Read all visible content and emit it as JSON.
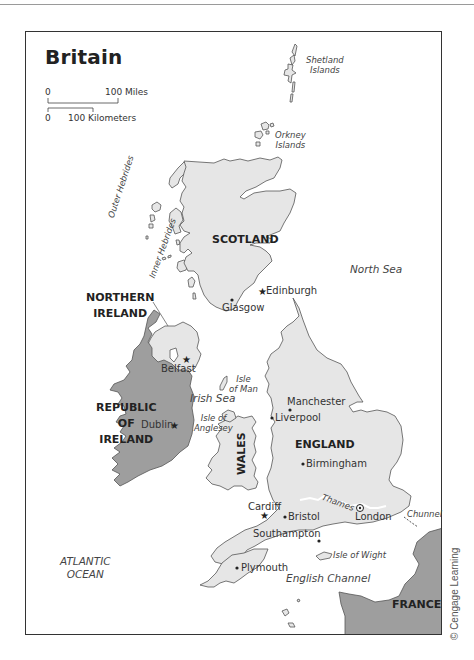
{
  "map": {
    "title": "Britain",
    "scale": {
      "miles_start": "0",
      "miles_end": "100 Miles",
      "km_start": "0",
      "km_end": "100 Kilometers"
    },
    "regions": {
      "scotland": "SCOTLAND",
      "northern_ireland_line1": "NORTHERN",
      "northern_ireland_line2": "IRELAND",
      "republic_line1": "REPUBLIC",
      "republic_line2": "OF",
      "republic_line3": "IRELAND",
      "england": "ENGLAND",
      "wales": "WALES",
      "france": "FRANCE"
    },
    "islands": {
      "shetland_line1": "Shetland",
      "shetland_line2": "Islands",
      "orkney_line1": "Orkney",
      "orkney_line2": "Islands",
      "outer_hebrides": "Outer Hebrides",
      "inner_hebrides": "Inner Hebrides",
      "isle_of_man_line1": "Isle",
      "isle_of_man_line2": "of Man",
      "anglesey_line1": "Isle of",
      "anglesey_line2": "Anglesey",
      "isle_of_wight": "Isle of Wight"
    },
    "seas": {
      "north_sea": "North Sea",
      "irish_sea": "Irish Sea",
      "atlantic_line1": "ATLANTIC",
      "atlantic_line2": "OCEAN",
      "english_channel": "English Channel"
    },
    "features": {
      "thames": "Thames",
      "chunnel": "Chunnel"
    },
    "cities": {
      "edinburgh": "Edinburgh",
      "glasgow": "Glasgow",
      "belfast": "Belfast",
      "dublin": "Dublin",
      "manchester": "Manchester",
      "liverpool": "Liverpool",
      "birmingham": "Birmingham",
      "cardiff": "Cardiff",
      "bristol": "Bristol",
      "london": "London",
      "southampton": "Southampton",
      "plymouth": "Plymouth"
    },
    "colors": {
      "uk_fill": "#e6e6e6",
      "other_fill": "#9e9e9e",
      "outline": "#555555",
      "thames": "#ffffff"
    },
    "copyright": "© Cengage Learning"
  }
}
